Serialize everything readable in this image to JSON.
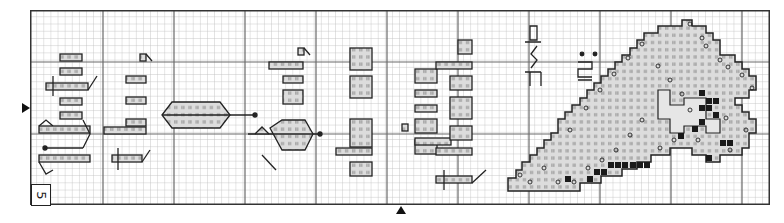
{
  "chart": {
    "page_number": "5",
    "grid": {
      "columns": 104,
      "rows": 27,
      "cell_px": 7.12,
      "heavy_line_every": 10
    },
    "words_rotated": [
      "With",
      "thee,",
      "O",
      "Lord,",
      "all",
      "give",
      "thanks"
    ],
    "reference": {
      "book": "Psalm",
      "verse": "151"
    },
    "center_markers": {
      "left_arrow_y": 108,
      "bottom_arrow_x": 400
    },
    "colors": {
      "grid_light": "#b8b8b8",
      "grid_heavy": "#555555",
      "border": "#333333",
      "fill_light": "#d9d9d9",
      "fill_dark": "#1a1a1a",
      "outline": "#222222"
    },
    "symbols": {
      "light_fill": "ii",
      "ring": "o",
      "solid": "■"
    }
  }
}
